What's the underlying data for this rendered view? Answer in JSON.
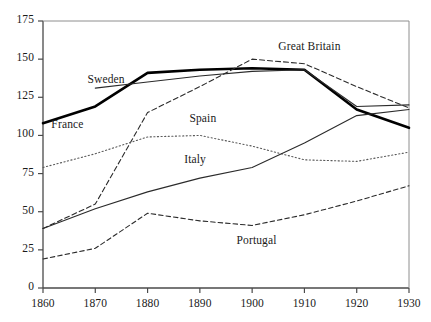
{
  "chart_data": {
    "type": "line",
    "title": "",
    "subtitle": "",
    "xlabel": "",
    "ylabel": "",
    "xlim": [
      1860,
      1930
    ],
    "ylim": [
      0,
      175
    ],
    "grid": false,
    "legend_position": "inline-labels",
    "x": [
      1860,
      1870,
      1880,
      1890,
      1900,
      1910,
      1920,
      1930
    ],
    "xticks": [
      "1860",
      "1870",
      "1880",
      "1890",
      "1900",
      "1910",
      "1920",
      "1930"
    ],
    "yticks": [
      "0",
      "25",
      "50",
      "75",
      "100",
      "125",
      "150",
      "175"
    ],
    "series": [
      {
        "name": "France",
        "style": "solid-thick",
        "color": "#000000",
        "width": 2.6,
        "dash": "none",
        "label_x": 1861.6,
        "label_y": 106,
        "values": [
          108,
          119,
          141,
          143,
          144,
          143,
          117,
          105
        ]
      },
      {
        "name": "Sweden",
        "style": "solid-thin",
        "color": "#2b2b2b",
        "width": 1.1,
        "dash": "none",
        "label_x": 1868.5,
        "label_y": 136,
        "values": [
          null,
          131,
          135,
          139,
          142,
          143,
          119,
          120
        ]
      },
      {
        "name": "Great Britain",
        "style": "dashed",
        "color": "#2b2b2b",
        "width": 1.1,
        "dash": "5,3",
        "label_x": 1905,
        "label_y": 157,
        "values": [
          39,
          55,
          115,
          132,
          150,
          147,
          132,
          118
        ]
      },
      {
        "name": "Spain",
        "style": "dotted",
        "color": "#5a5a5a",
        "width": 1.1,
        "dash": "1.2,2.4",
        "label_x": 1888,
        "label_y": 110,
        "values": [
          79,
          88,
          99,
          100,
          93,
          84,
          83,
          89
        ]
      },
      {
        "name": "Italy",
        "style": "solid-thin",
        "color": "#2b2b2b",
        "width": 1.1,
        "dash": "none",
        "label_x": 1887,
        "label_y": 83,
        "values": [
          39,
          52,
          63,
          72,
          79,
          95,
          113,
          117
        ]
      },
      {
        "name": "Portugal",
        "style": "dashed",
        "color": "#2b2b2b",
        "width": 1.1,
        "dash": "4.5,3",
        "label_x": 1897,
        "label_y": 30,
        "values": [
          19,
          26,
          49,
          44,
          41,
          48,
          57,
          67
        ]
      }
    ]
  },
  "axes": {
    "x_axis_name": "year-axis",
    "y_axis_name": "index-axis",
    "frame_color": "#4a4a4a"
  }
}
